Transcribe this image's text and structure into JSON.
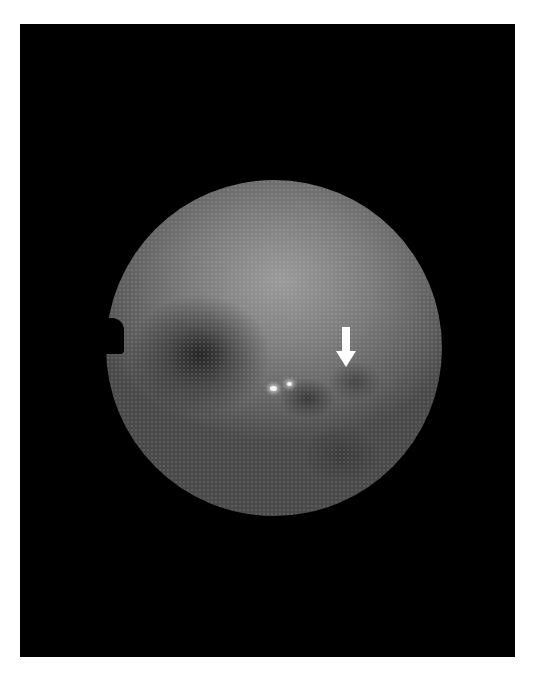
{
  "image": {
    "type": "fundus-photograph",
    "colors": {
      "background": "#ffffff",
      "frame": "#000000",
      "fundus_mid": "#7b7b7b",
      "arrow": "#ffffff"
    },
    "annotations": [
      {
        "kind": "arrow",
        "direction": "down",
        "color": "#ffffff"
      }
    ],
    "features": [
      "circular-field-of-view",
      "dark-optic-disc-region",
      "bright-reflex-spots",
      "dark-lesion-spots"
    ]
  }
}
